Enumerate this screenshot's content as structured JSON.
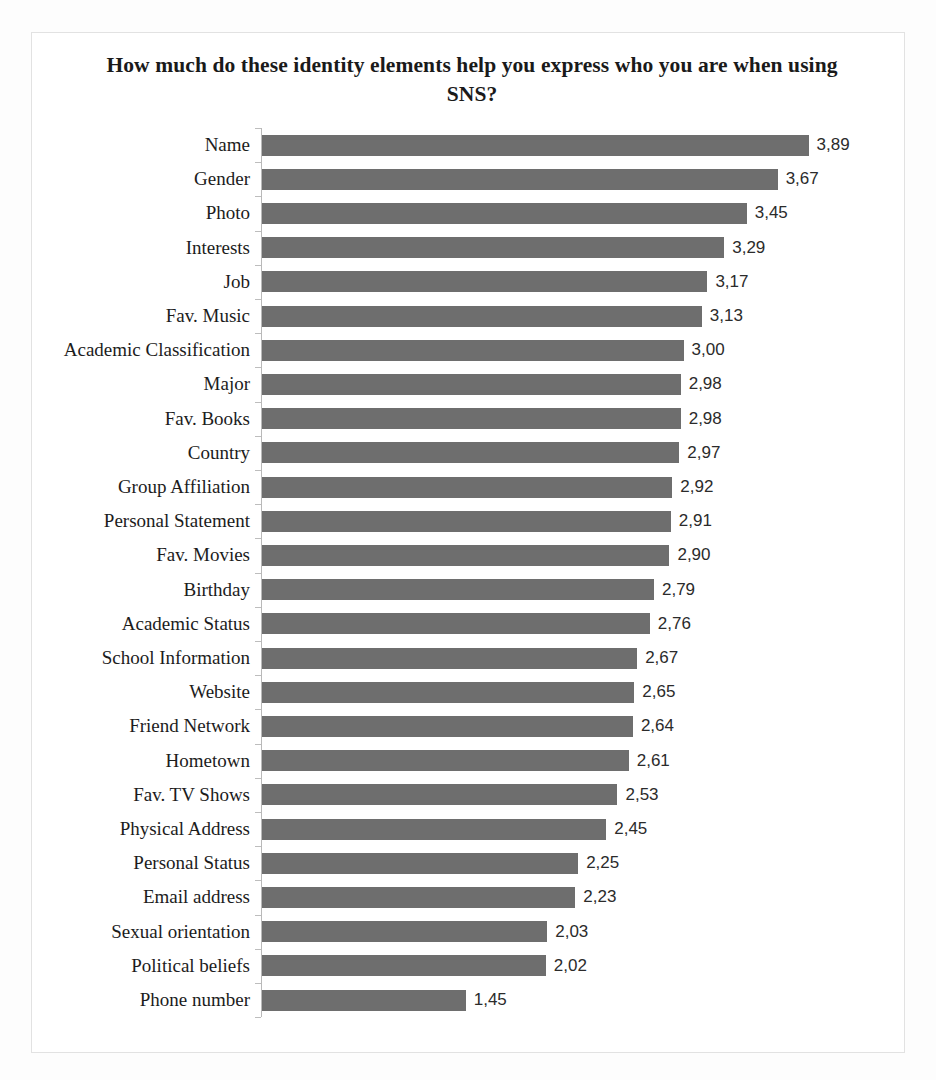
{
  "chart": {
    "title": "How much do these identity elements help you express who you are when using SNS?",
    "bar_color": "#6e6e6e",
    "axis_color": "#b9b9b9",
    "frame_color": "#e2e2e2",
    "background": "#ffffff"
  },
  "chart_data": {
    "type": "bar",
    "orientation": "horizontal",
    "title": "How much do these identity elements help you express who you are when using SNS?",
    "xlabel": "",
    "ylabel": "",
    "xlim": [
      0,
      4.2
    ],
    "grid": false,
    "legend": null,
    "decimal_separator": ",",
    "categories": [
      "Name",
      "Gender",
      "Photo",
      "Interests",
      "Job",
      "Fav. Music",
      "Academic Classification",
      "Major",
      "Fav. Books",
      "Country",
      "Group Affiliation",
      "Personal Statement",
      "Fav. Movies",
      "Birthday",
      "Academic Status",
      "School Information",
      "Website",
      "Friend Network",
      "Hometown",
      "Fav. TV Shows",
      "Physical Address",
      "Personal Status",
      "Email address",
      "Sexual orientation",
      "Political beliefs",
      "Phone number"
    ],
    "values": [
      3.89,
      3.67,
      3.45,
      3.29,
      3.17,
      3.13,
      3.0,
      2.98,
      2.98,
      2.97,
      2.92,
      2.91,
      2.9,
      2.79,
      2.76,
      2.67,
      2.65,
      2.64,
      2.61,
      2.53,
      2.45,
      2.25,
      2.23,
      2.03,
      2.02,
      1.45
    ],
    "data_labels": [
      "3,89",
      "3,67",
      "3,45",
      "3,29",
      "3,17",
      "3,13",
      "3,00",
      "2,98",
      "2,98",
      "2,97",
      "2,92",
      "2,91",
      "2,90",
      "2,79",
      "2,76",
      "2,67",
      "2,65",
      "2,64",
      "2,61",
      "2,53",
      "2,45",
      "2,25",
      "2,23",
      "2,03",
      "2,02",
      "1,45"
    ]
  }
}
